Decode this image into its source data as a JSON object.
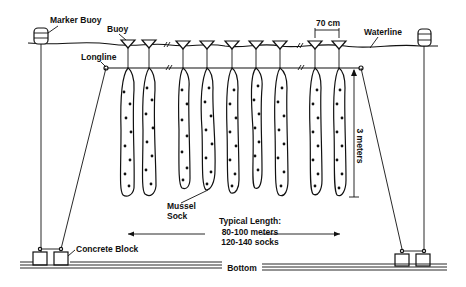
{
  "diagram": {
    "labels": {
      "marker_buoy": "Marker Buoy",
      "buoy": "Buoy",
      "longline": "Longline",
      "spacing": "70 cm",
      "waterline": "Waterline",
      "depth": "3 meters",
      "mussel_sock_line1": "Mussel",
      "mussel_sock_line2": "Sock",
      "length_title": "Typical Length:",
      "length_meters": "80-100 meters",
      "length_socks": "120-140 socks",
      "concrete_block": "Concrete Block",
      "bottom": "Bottom"
    },
    "buoy_x": [
      128,
      149,
      183,
      207,
      232,
      256,
      280,
      315,
      339
    ],
    "sock_count": 9,
    "colors": {
      "ink": "#111111",
      "background": "#ffffff"
    }
  }
}
